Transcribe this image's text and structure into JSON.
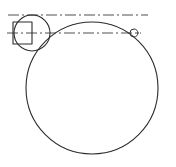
{
  "figure": {
    "background_color": "#ffffff",
    "stroke_color": "#2b2b2b",
    "centerline_color": "#3a3a3a",
    "canvas": {
      "width": 176,
      "height": 167
    }
  },
  "chart_data": {
    "type": "diagram",
    "xlabel": "",
    "ylabel": "",
    "xlim": [
      0,
      176
    ],
    "ylim": [
      0,
      167
    ],
    "grid": false,
    "legend": "none",
    "shapes": [
      {
        "name": "large-circle",
        "kind": "circle",
        "cx": 92,
        "cy": 88,
        "r": 66,
        "stroke": "#2b2b2b",
        "stroke_width": 1.1,
        "fill": "none",
        "line_style": "solid"
      },
      {
        "name": "small-circle",
        "kind": "circle",
        "cx": 32,
        "cy": 33,
        "r": 18,
        "stroke": "#2b2b2b",
        "stroke_width": 1.1,
        "fill": "none",
        "line_style": "solid"
      },
      {
        "name": "tiny-circle",
        "kind": "circle",
        "cx": 134,
        "cy": 33,
        "r": 4,
        "stroke": "#2b2b2b",
        "stroke_width": 1.1,
        "fill": "none",
        "line_style": "solid"
      },
      {
        "name": "square",
        "kind": "rect",
        "x": 13,
        "y": 22,
        "width": 19,
        "height": 22,
        "stroke": "#2b2b2b",
        "stroke_width": 1.1,
        "fill": "none",
        "line_style": "solid"
      },
      {
        "name": "upper-centerline",
        "kind": "line",
        "x1": 8,
        "y1": 15,
        "x2": 148,
        "y2": 15,
        "stroke": "#3a3a3a",
        "stroke_width": 0.9,
        "line_style": "dash-dot"
      },
      {
        "name": "lower-centerline",
        "kind": "line",
        "x1": 7,
        "y1": 33,
        "x2": 141,
        "y2": 33,
        "stroke": "#3a3a3a",
        "stroke_width": 0.9,
        "line_style": "dash-dot"
      }
    ],
    "annotations": [
      {
        "name": "tangency-top",
        "x": 92,
        "y": 17,
        "text": ""
      },
      {
        "name": "intersection-small-large",
        "x": 46,
        "y": 47,
        "text": ""
      }
    ]
  }
}
